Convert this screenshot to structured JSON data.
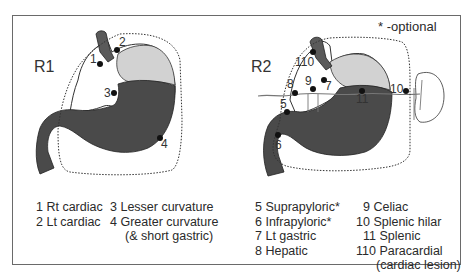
{
  "note": "* -optional",
  "panels": [
    {
      "label": "R1",
      "legend_col1": [
        "1 Rt cardiac",
        "2 Lt cardiac"
      ],
      "legend_col2": [
        "3 Lesser curvature",
        "4 Greater curvature",
        "(& short gastric)"
      ],
      "stations": [
        {
          "id": "1",
          "name": "Rt cardiac"
        },
        {
          "id": "2",
          "name": "Lt cardiac"
        },
        {
          "id": "3",
          "name": "Lesser curvature"
        },
        {
          "id": "4",
          "name": "Greater curvature (& short gastric)"
        }
      ]
    },
    {
      "label": "R2",
      "legend_col1": [
        "5 Suprapyloric*",
        "6 Infrapyloric*",
        "7 Lt gastric",
        "8 Hepatic"
      ],
      "legend_col2": [
        "9 Celiac",
        "10 Splenic hilar",
        "11 Splenic",
        "110 Paracardial",
        "(cardiac lesion)"
      ],
      "stations": [
        {
          "id": "5",
          "name": "Suprapyloric",
          "optional": true
        },
        {
          "id": "6",
          "name": "Infrapyloric",
          "optional": true
        },
        {
          "id": "7",
          "name": "Lt gastric"
        },
        {
          "id": "8",
          "name": "Hepatic"
        },
        {
          "id": "9",
          "name": "Celiac"
        },
        {
          "id": "10",
          "name": "Splenic hilar"
        },
        {
          "id": "11",
          "name": "Splenic"
        },
        {
          "id": "110",
          "name": "Paracardial (cardiac lesion)"
        }
      ]
    }
  ],
  "colors": {
    "stomach_dark": "#4a4a4a",
    "fundus_light": "#cfcfcf",
    "esophagus": "#5a5a5a",
    "border": "#6a6a6a",
    "node": "#111111"
  }
}
